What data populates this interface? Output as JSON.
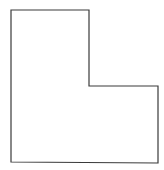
{
  "diagram": {
    "shape": "L-shaped polygon",
    "stroke_color": "#3a3a3a",
    "fill_color": "#ffffff",
    "stroke_width": 1.2,
    "points": [
      [
        11,
        10
      ],
      [
        89,
        10
      ],
      [
        89,
        86
      ],
      [
        158,
        86
      ],
      [
        158,
        163
      ],
      [
        11,
        162
      ]
    ]
  }
}
